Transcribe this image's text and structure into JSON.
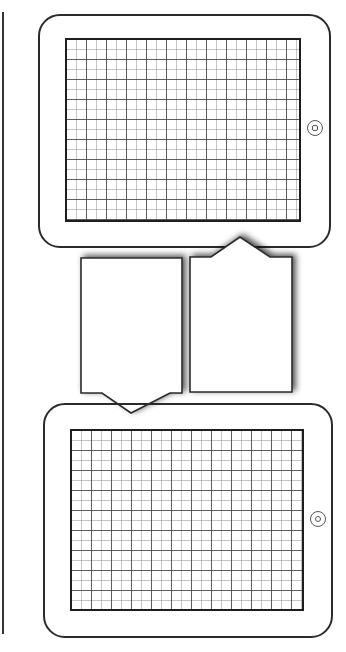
{
  "diagram": {
    "title": "",
    "colors": {
      "stroke": "#2a2a2a",
      "grid_major": "#3c3c3c",
      "grid_minor": "#8c8c8c",
      "background": "#ffffff",
      "shadow": "#000000"
    },
    "tablets": [
      {
        "id": "top-tablet",
        "orientation": "landscape",
        "home_button": "square-in-circle",
        "screen": "grid"
      },
      {
        "id": "bottom-tablet",
        "orientation": "landscape",
        "home_button": "circle-in-circle",
        "screen": "grid"
      }
    ],
    "callouts": [
      {
        "id": "left-callout",
        "pointer": "down",
        "text": ""
      },
      {
        "id": "right-callout",
        "pointer": "up",
        "text": ""
      }
    ],
    "grid": {
      "minor_cell_px": 10,
      "major_every": 2
    }
  }
}
